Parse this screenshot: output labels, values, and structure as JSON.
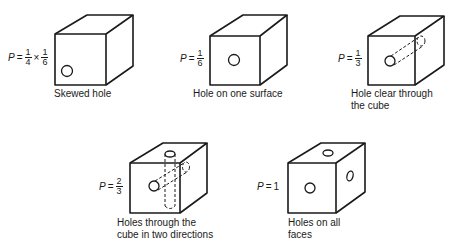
{
  "figures": [
    {
      "id": "skewed-hole",
      "caption": [
        "Skewed hole"
      ],
      "probability": {
        "symbol": "P",
        "equals": "=",
        "fraction1": {
          "num": "1",
          "den": "4"
        },
        "times": "×",
        "fraction2": {
          "num": "1",
          "den": "6"
        }
      }
    },
    {
      "id": "hole-one-surface",
      "caption": [
        "Hole on one surface"
      ],
      "probability": {
        "symbol": "P",
        "equals": "=",
        "fraction1": {
          "num": "1",
          "den": "6"
        }
      }
    },
    {
      "id": "hole-clear-through",
      "caption": [
        "Hole clear through",
        "the cube"
      ],
      "probability": {
        "symbol": "P",
        "equals": "=",
        "fraction1": {
          "num": "1",
          "den": "3"
        }
      }
    },
    {
      "id": "holes-two-directions",
      "caption": [
        "Holes through the",
        "cube in two directions"
      ],
      "probability": {
        "symbol": "P",
        "equals": "=",
        "fraction1": {
          "num": "2",
          "den": "3"
        }
      }
    },
    {
      "id": "holes-all-faces",
      "caption": [
        "Holes on all",
        "faces"
      ],
      "probability": {
        "symbol": "P",
        "equals": "=",
        "value": "1"
      }
    }
  ],
  "colors": {
    "line": "#1a1a1a",
    "background": "#ffffff"
  }
}
